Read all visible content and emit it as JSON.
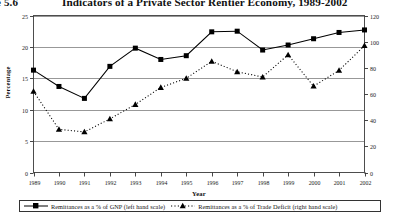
{
  "figure": {
    "number_label": "re 5.6",
    "title": "Indicators of a Private Sector Rentier Economy, 1989-2002"
  },
  "axes": {
    "y_left_label": "Percentage",
    "x_label": "Year",
    "y_left_ticks": [
      "0",
      "5",
      "10",
      "15",
      "20",
      "25"
    ],
    "y_right_ticks": [
      "0",
      "20",
      "40",
      "60",
      "80",
      "100",
      "120"
    ],
    "x_ticks": [
      "1989",
      "1990",
      "1991",
      "1992",
      "1993",
      "1994",
      "1995",
      "1996",
      "1997",
      "1998",
      "1999",
      "2000",
      "2001",
      "2002"
    ]
  },
  "legend": {
    "items": [
      {
        "label": "Remittances as a % of GNP (left hand scale)",
        "marker": "square-marker",
        "line": "solid"
      },
      {
        "label": "Remittances as a % of Trade Deficit (right hand scale)",
        "marker": "triangle-marker",
        "line": "dotted"
      }
    ]
  },
  "colors": {
    "line": "#000000",
    "grid": "#8c8c8c",
    "frame": "#4d4d4d",
    "text": "#111111"
  },
  "chart_data": {
    "type": "line",
    "title": "Indicators of a Private Sector Rentier Economy, 1989-2002",
    "xlabel": "Year",
    "ylabel": "Percentage",
    "grid": true,
    "legend_position": "bottom",
    "x": [
      "1989",
      "1990",
      "1991",
      "1992",
      "1993",
      "1994",
      "1995",
      "1996",
      "1997",
      "1998",
      "1999",
      "2000",
      "2001",
      "2002"
    ],
    "ylim_left": [
      0,
      25
    ],
    "ylim_right": [
      0,
      120
    ],
    "series": [
      {
        "name": "Remittances as a % of GNP (left hand scale)",
        "axis": "left",
        "style": "solid",
        "marker": "square",
        "values": [
          16.3,
          13.7,
          11.8,
          16.9,
          19.8,
          18.0,
          18.6,
          22.4,
          22.5,
          19.5,
          20.3,
          21.3,
          22.3,
          22.7
        ]
      },
      {
        "name": "Remittances as a % of Trade Deficit (right hand scale)",
        "axis": "right",
        "style": "dotted",
        "marker": "triangle",
        "values": [
          62,
          33,
          31,
          41,
          52,
          65,
          72,
          85,
          77,
          73,
          90,
          66,
          78,
          97
        ]
      }
    ]
  }
}
